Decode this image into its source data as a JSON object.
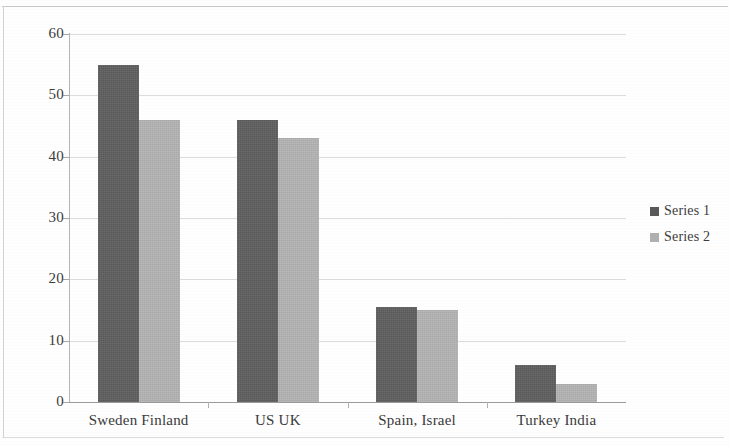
{
  "chart_data": {
    "type": "bar",
    "title": "",
    "subtitle": "",
    "xlabel": "",
    "ylabel": "",
    "categories": [
      "Sweden Finland",
      "US UK",
      "Spain, Israel",
      "Turkey India"
    ],
    "series": [
      {
        "name": "Series 1",
        "color": "#595959",
        "values": [
          55,
          46,
          15.5,
          6
        ]
      },
      {
        "name": "Series 2",
        "color": "#a9a9a9",
        "values": [
          46,
          43,
          15,
          3
        ]
      }
    ],
    "ylim": [
      0,
      60
    ],
    "ytick_values": [
      0,
      10,
      20,
      30,
      40,
      50,
      60
    ],
    "ytick_labels": [
      "0",
      "10",
      "20",
      "30",
      "40",
      "50",
      "60"
    ],
    "grid": true,
    "grid_axis": "y",
    "legend_position": "right",
    "legend_entries": [
      "Series 1",
      "Series 2"
    ],
    "annotations": []
  },
  "legend": {
    "items": [
      {
        "label": "Series 1",
        "swatch": "series-1-swatch"
      },
      {
        "label": "Series 2",
        "swatch": "series-2-swatch"
      }
    ]
  },
  "colors": {
    "series_1": "#595959",
    "series_2": "#a9a9a9",
    "gridline": "#dcdcdc",
    "axis": "#9b9b9b",
    "text": "#3a3a3a",
    "background": "#ffffff"
  }
}
